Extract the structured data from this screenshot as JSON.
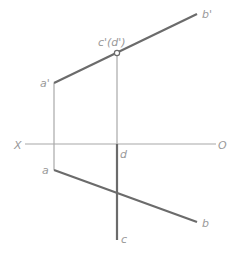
{
  "diagram": {
    "type": "orthographic-projection",
    "colors": {
      "thick": "#6b6b6b",
      "thin": "#a8a8a8",
      "label": "#9a9a9a"
    },
    "axis": {
      "left_label": "X",
      "right_label": "O"
    },
    "points": {
      "a_prime": "a'",
      "b_prime": "b'",
      "c_prime_d_prime": "c'(d')",
      "a": "a",
      "b": "b",
      "c": "c",
      "d": "d"
    }
  }
}
